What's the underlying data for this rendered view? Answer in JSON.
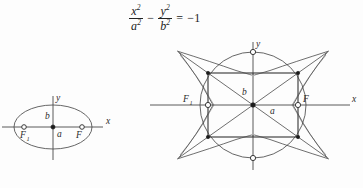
{
  "figure": {
    "kind": "math-textbook-figure",
    "background_color": "#fdfdfd",
    "ink_color": "#3a3a3a"
  },
  "equation": {
    "description": "conjugate hyperbola equation",
    "term1_numerator": "x",
    "term1_numerator_exp": "2",
    "term1_denominator": "a",
    "term1_denominator_exp": "2",
    "operator": "−",
    "term2_numerator": "y",
    "term2_numerator_exp": "2",
    "term2_denominator": "b",
    "term2_denominator_exp": "2",
    "equals": "=",
    "right_hand_side": "−1",
    "plain_text": "x²/a² − y²/b² = −1"
  },
  "ellipse_diagram": {
    "name": "ellipse-figure",
    "x_axis_label": "x",
    "y_axis_label": "y",
    "semi_minor_label": "b",
    "semi_major_label": "a",
    "focus_left_label": "F",
    "focus_left_subscript": "1",
    "focus_right_label": "F",
    "center_marker": "filled-dot",
    "focus_marker": "open-circle"
  },
  "hyperbola_diagram": {
    "name": "conjugate-hyperbola-figure",
    "x_axis_label": "x",
    "y_axis_label": "y",
    "semi_axis_vertical_label": "b",
    "semi_axis_horizontal_label": "a",
    "focus_left_label": "F",
    "focus_left_subscript": "1",
    "focus_right_label": "F",
    "center_marker": "filled-dot",
    "focus_marker": "open-circle",
    "vertex_marker": "open-circle",
    "corner_marker": "filled-dot",
    "features": [
      "circumscribed-circle",
      "fundamental-rectangle",
      "asymptote-diagonals",
      "horizontal-branches",
      "vertical-branches"
    ]
  }
}
